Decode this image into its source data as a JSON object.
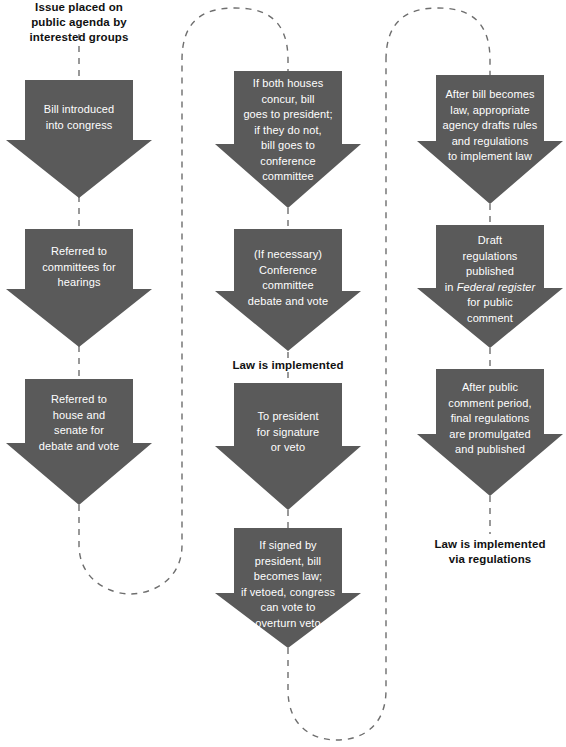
{
  "diagram": {
    "title_label": "Issue placed on\npublic agenda by\ninterested groups",
    "arrow_color": "#5a5a5a",
    "connector_color": "#6e6e6e",
    "text_color_on_arrow": "#ffffff",
    "text_color_label": "#111111",
    "columns": [
      {
        "name": "legislative-origin",
        "arrows": [
          {
            "id": "bill-introduced",
            "text": "Bill introduced\ninto congress"
          },
          {
            "id": "referred-committees",
            "text": "Referred to\ncommittees for\nhearings"
          },
          {
            "id": "referred-house-senate",
            "text": "Referred to\nhouse and\nsenate for\ndebate and vote"
          }
        ],
        "stage_labels": []
      },
      {
        "name": "congressional-action",
        "arrows": [
          {
            "id": "both-houses-concur",
            "text": "If both houses\nconcur, bill\ngoes to president;\nif they do not,\nbill goes to\nconference\ncommittee"
          },
          {
            "id": "conference-committee",
            "text": "(If necessary)\nConference\ncommittee\ndebate and vote"
          },
          {
            "id": "to-president",
            "text": "To president\nfor signature\nor veto"
          },
          {
            "id": "signed-or-vetoed",
            "text": "If signed by\npresident, bill\nbecomes law;\nif vetoed, congress\ncan vote to\noverturn veto"
          }
        ],
        "stage_labels": [
          {
            "id": "law-is-implemented",
            "text": "Law is implemented"
          }
        ]
      },
      {
        "name": "regulatory-action",
        "arrows": [
          {
            "id": "agency-drafts-rules",
            "text": "After bill becomes\nlaw, appropriate\nagency drafts rules\nand regulations\nto implement law"
          },
          {
            "id": "draft-regulations-published",
            "text_parts": [
              {
                "t": "Draft\nregulations\npublished\nin ",
                "italic": false
              },
              {
                "t": "Federal register",
                "italic": true
              },
              {
                "t": "\nfor public\ncomment",
                "italic": false
              }
            ]
          },
          {
            "id": "final-regulations",
            "text": "After public\ncomment period,\nfinal regulations\nare promulgated\nand published"
          }
        ],
        "stage_labels": [
          {
            "id": "law-implemented-via-regulations",
            "text": "Law is implemented\nvia regulations"
          }
        ]
      }
    ]
  }
}
